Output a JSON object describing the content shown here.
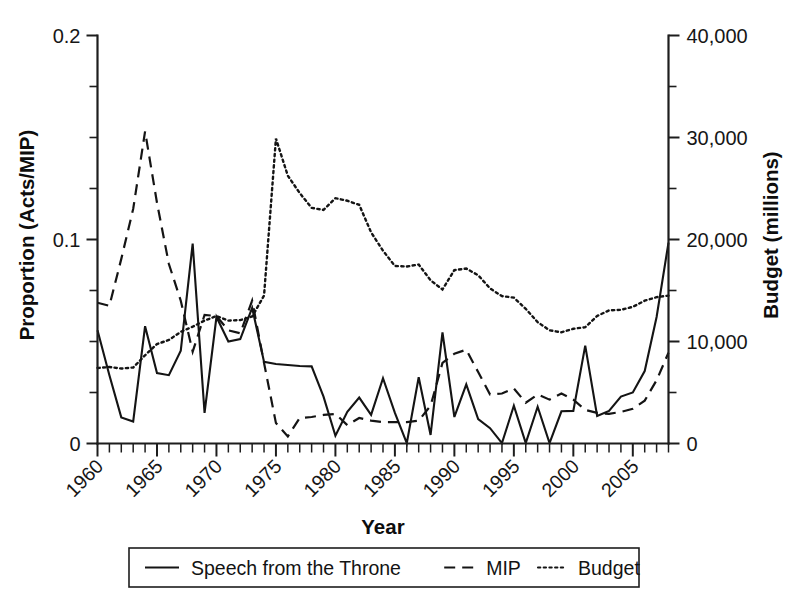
{
  "chart_data": {
    "type": "line",
    "title": "",
    "xlabel": "Year",
    "ylabel": "Proportion (Acts/MIP)",
    "y2label": "Budget (millions)",
    "xlim": [
      1960,
      2008
    ],
    "ylim": [
      0,
      0.2
    ],
    "y2lim": [
      0,
      40000
    ],
    "grid": false,
    "legend_position": "bottom-outside",
    "xticks": [
      "1960",
      "1965",
      "1970",
      "1975",
      "1980",
      "1985",
      "1990",
      "1995",
      "2000",
      "2005"
    ],
    "xtick_values": [
      1960,
      1965,
      1970,
      1975,
      1980,
      1985,
      1990,
      1995,
      2000,
      2005
    ],
    "xtick_rotation_deg": 45,
    "yticks": [
      "0",
      "0.1",
      "0.2"
    ],
    "ytick_values": [
      0,
      0.1,
      0.2
    ],
    "y_minor_values": [
      0.025,
      0.05,
      0.075,
      0.125,
      0.15,
      0.175
    ],
    "y2ticks": [
      "0",
      "10,000",
      "20,000",
      "30,000",
      "40,000"
    ],
    "y2tick_values": [
      0,
      10000,
      20000,
      30000,
      40000
    ],
    "y2_minor_values": [
      5000,
      15000,
      25000,
      35000
    ],
    "x": [
      1960,
      1961,
      1962,
      1963,
      1964,
      1965,
      1966,
      1967,
      1968,
      1969,
      1970,
      1971,
      1972,
      1973,
      1974,
      1975,
      1976,
      1977,
      1978,
      1979,
      1980,
      1981,
      1982,
      1983,
      1984,
      1985,
      1986,
      1987,
      1988,
      1989,
      1990,
      1991,
      1992,
      1993,
      1994,
      1995,
      1996,
      1997,
      1998,
      1999,
      2000,
      2001,
      2002,
      2003,
      2004,
      2005,
      2006,
      2007,
      2008
    ],
    "series": [
      {
        "name": "Speech from the Throne",
        "style": "solid",
        "axis": "left",
        "units": "Proportion (Acts/MIP)",
        "values": [
          0.0555,
          0.0335,
          0.0128,
          0.0108,
          0.0575,
          0.0345,
          0.0335,
          0.0455,
          0.098,
          0.015,
          0.062,
          0.05,
          0.0512,
          0.0665,
          0.04,
          0.039,
          0.0385,
          0.038,
          0.0378,
          0.023,
          0.0038,
          0.0155,
          0.0225,
          0.014,
          0.032,
          0.015,
          0.0002,
          0.0325,
          0.0042,
          0.0545,
          0.013,
          0.029,
          0.012,
          0.0075,
          0.0002,
          0.0185,
          0.0002,
          0.018,
          0.0002,
          0.0158,
          0.016,
          0.048,
          0.0135,
          0.016,
          0.023,
          0.025,
          0.0355,
          0.062,
          0.0985
        ]
      },
      {
        "name": "MIP",
        "style": "dashed",
        "axis": "left",
        "units": "Proportion (Acts/MIP)",
        "values": [
          0.069,
          0.0675,
          0.0905,
          0.115,
          0.153,
          0.118,
          0.088,
          0.07,
          0.045,
          0.063,
          0.0625,
          0.0555,
          0.054,
          0.07,
          0.0395,
          0.01,
          0.0035,
          0.0125,
          0.013,
          0.014,
          0.0145,
          0.009,
          0.0125,
          0.0112,
          0.0105,
          0.0105,
          0.0105,
          0.0112,
          0.0185,
          0.0395,
          0.044,
          0.046,
          0.035,
          0.024,
          0.0245,
          0.027,
          0.02,
          0.024,
          0.0215,
          0.0245,
          0.0215,
          0.0165,
          0.015,
          0.0145,
          0.0155,
          0.017,
          0.021,
          0.031,
          0.0445
        ]
      },
      {
        "name": "Budget",
        "style": "dotted",
        "axis": "right",
        "units": "Budget (millions)",
        "values": [
          7400,
          7500,
          7350,
          7450,
          8650,
          9750,
          10150,
          10950,
          11450,
          12050,
          12500,
          12050,
          12100,
          12450,
          14500,
          29900,
          26250,
          24550,
          23100,
          22900,
          24050,
          23800,
          23400,
          20700,
          18900,
          17400,
          17350,
          17550,
          16000,
          15100,
          17000,
          17150,
          16500,
          15200,
          14450,
          14300,
          13200,
          11900,
          11100,
          10900,
          11250,
          11400,
          12500,
          13050,
          13100,
          13400,
          14000,
          14350,
          14500
        ]
      }
    ]
  },
  "legend": {
    "items": [
      {
        "label": "Speech from the Throne",
        "style": "solid"
      },
      {
        "label": "MIP",
        "style": "dashed"
      },
      {
        "label": "Budget",
        "style": "dotted"
      }
    ]
  }
}
